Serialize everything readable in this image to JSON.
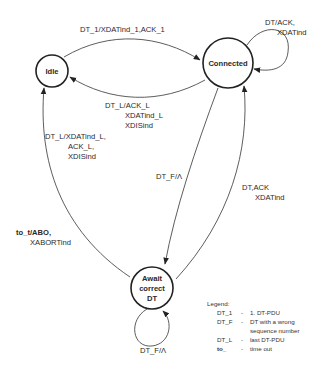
{
  "diagram": {
    "type": "state-machine",
    "states": [
      {
        "id": "idle",
        "label": "Idle"
      },
      {
        "id": "connected",
        "label": "Connected"
      },
      {
        "id": "await",
        "label_lines": [
          "Await",
          "correct",
          "DT"
        ]
      }
    ],
    "transitions": [
      {
        "id": "idle_to_connected",
        "from": "idle",
        "to": "connected",
        "label_lines": [
          "DT_1/XDATind_1,ACK_1"
        ]
      },
      {
        "id": "connected_self",
        "from": "connected",
        "to": "connected",
        "label_lines": [
          "DT/ACK,",
          "XDATind"
        ]
      },
      {
        "id": "connected_to_idle",
        "from": "connected",
        "to": "idle",
        "label_lines": [
          "DT_L/ACK_L",
          "XDATind_L",
          "XDISind"
        ]
      },
      {
        "id": "await_to_idle_last",
        "from": "await",
        "to": "idle",
        "label_lines": [
          "DT_L/XDATind_L,",
          "ACK_L,",
          "XDISind"
        ]
      },
      {
        "id": "connected_to_await",
        "from": "connected",
        "to": "await",
        "label_lines": [
          "DT_F/Λ"
        ]
      },
      {
        "id": "await_to_connected",
        "from": "await",
        "to": "connected",
        "label_lines": [
          "DT,ACK",
          "XDATind"
        ]
      },
      {
        "id": "await_timeout",
        "from": "await",
        "to": "idle",
        "label_lines": [
          "to_t/ABO,",
          "XABORTind"
        ]
      },
      {
        "id": "await_self",
        "from": "await",
        "to": "await",
        "label_lines": [
          "DT_F/Λ"
        ]
      }
    ],
    "legend": {
      "title": "Legend:",
      "entries": [
        {
          "key": "DT_1",
          "sep": "-",
          "value_lines": [
            "1. DT-PDU"
          ]
        },
        {
          "key": "DT_F",
          "sep": "-",
          "value_lines": [
            "DT with a wrong",
            "sequence number"
          ]
        },
        {
          "key": "DT_L",
          "sep": "-",
          "value_lines": [
            "last DT-PDU"
          ]
        },
        {
          "key": "to_",
          "sep": "-",
          "value_lines": [
            "time out"
          ]
        }
      ]
    }
  }
}
